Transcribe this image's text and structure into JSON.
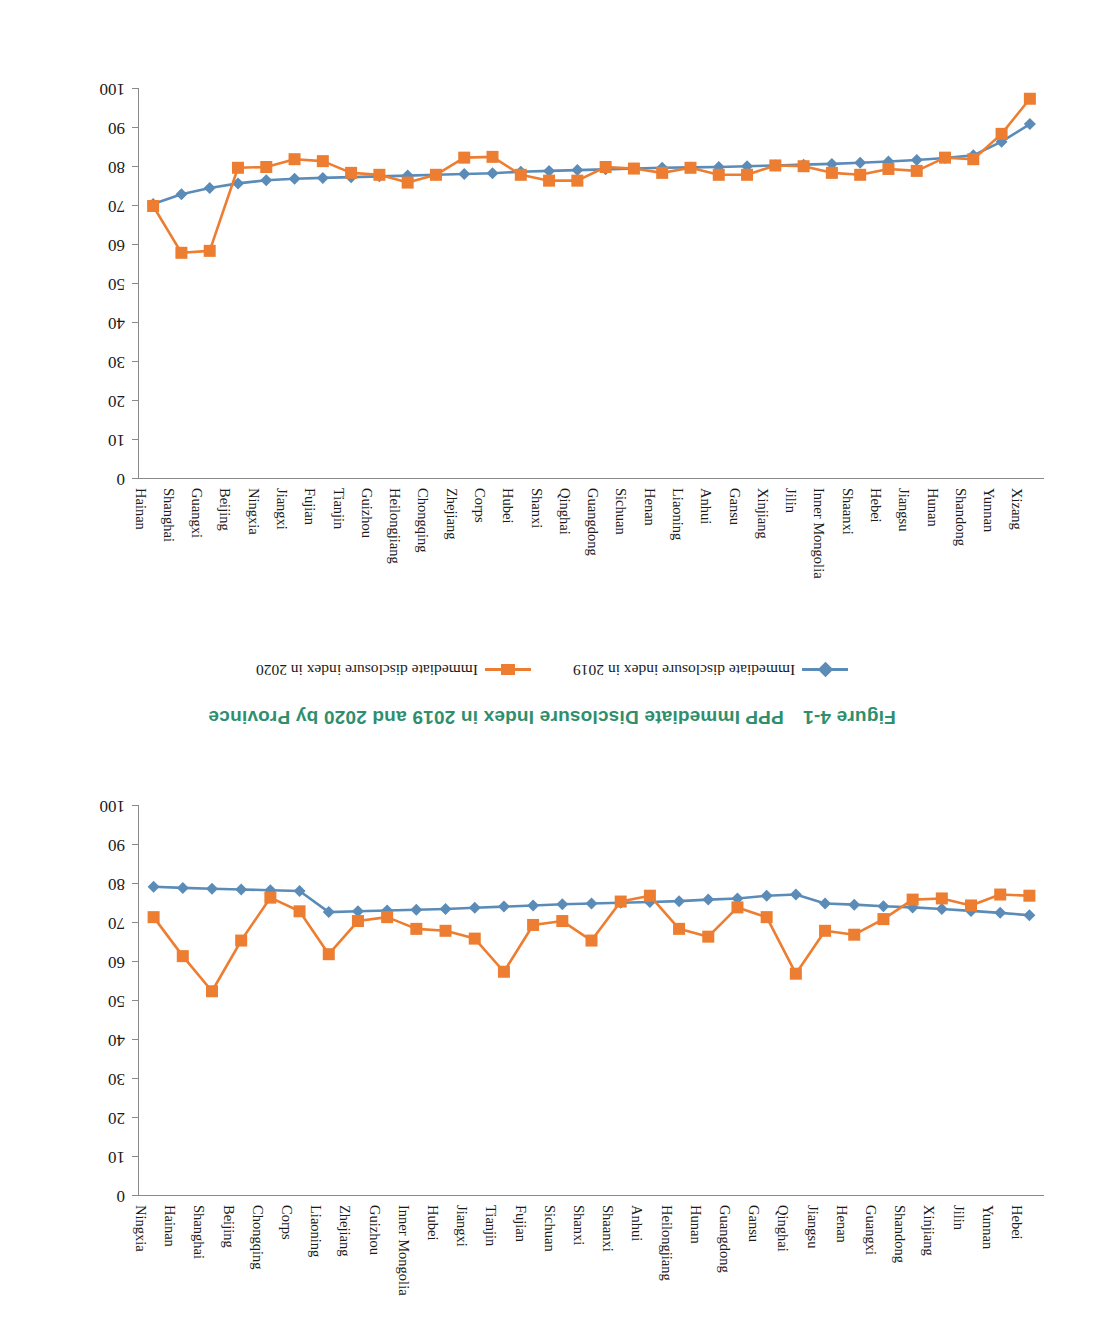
{
  "figure": {
    "title": "Figure 4-1　PPP Immediate Disclosure Index in 2019 and 2020 by Province",
    "title_color": "#2f8f6d"
  },
  "legend": {
    "position": "below-top-chart",
    "items": [
      {
        "label": "Immediate disclosure index in 2019",
        "marker": "diamond",
        "color": "#5b8cb8"
      },
      {
        "label": "Immediate disclosure index in 2020",
        "marker": "square",
        "color": "#ed7d31"
      }
    ]
  },
  "axis": {
    "y_ticks": [
      "0",
      "10",
      "20",
      "30",
      "40",
      "50",
      "60",
      "70",
      "80",
      "90",
      "100"
    ],
    "y_min": 0,
    "y_max": 100
  },
  "chart_data": [
    {
      "type": "line",
      "id": "top-chart",
      "title": "",
      "xlabel": "",
      "ylabel": "",
      "ylim": [
        0,
        100
      ],
      "y_inverted": true,
      "grid": false,
      "legend_position": "below",
      "categories": [
        "Hebei",
        "Yunnan",
        "Jilin",
        "Xinjiang",
        "Shandong",
        "Guangxi",
        "Henan",
        "Jiangsu",
        "Qinghai",
        "Gansu",
        "Guangdong",
        "Hunan",
        "Heilongjiang",
        "Anhui",
        "Shaanxi",
        "Shanxi",
        "Sichuan",
        "Fujian",
        "Tianjin",
        "Jiangxi",
        "Hubei",
        "Inner Mongolia",
        "Guizhou",
        "Zhejiang",
        "Liaoning",
        "Corps",
        "Chongqing",
        "Beijing",
        "Shanghai",
        "Hainan",
        "Ningxia"
      ],
      "series": [
        {
          "name": "Immediate disclosure index in 2019",
          "color": "#5b8cb8",
          "marker": "diamond",
          "values": [
            72.0,
            72.6,
            73.1,
            73.6,
            74.0,
            74.3,
            74.7,
            75.0,
            77.3,
            77.0,
            76.3,
            76.0,
            75.6,
            75.4,
            75.2,
            75.0,
            74.8,
            74.5,
            74.2,
            73.9,
            73.6,
            73.4,
            73.2,
            73.0,
            72.8,
            78.2,
            78.4,
            78.6,
            78.8,
            79.0,
            79.3
          ]
        },
        {
          "name": "Immediate disclosure index in 2020",
          "color": "#ed7d31",
          "marker": "square",
          "values": [
            77.0,
            77.3,
            74.5,
            76.3,
            76.0,
            71.0,
            67.0,
            68.0,
            57.0,
            71.5,
            74.0,
            66.5,
            68.5,
            77.0,
            75.5,
            65.5,
            70.5,
            69.5,
            57.5,
            66.0,
            68.0,
            68.5,
            71.5,
            70.5,
            62.0,
            73.0,
            76.5,
            65.5,
            52.5,
            61.5,
            71.5
          ]
        }
      ]
    },
    {
      "type": "line",
      "id": "bottom-chart",
      "title": "",
      "xlabel": "",
      "ylabel": "",
      "ylim": [
        0,
        100
      ],
      "y_inverted": true,
      "grid": false,
      "legend_position": "above",
      "categories": [
        "Xizang",
        "Yunnan",
        "Shandong",
        "Hunan",
        "Jiangsu",
        "Hebei",
        "Shaanxi",
        "Inner Mongolia",
        "Jilin",
        "Xinjiang",
        "Gansu",
        "Anhui",
        "Liaoning",
        "Henan",
        "Sichuan",
        "Guangdong",
        "Qinghai",
        "Shanxi",
        "Hubei",
        "Corps",
        "Zhejiang",
        "Chongqing",
        "Heilongjiang",
        "Guizhou",
        "Tianjin",
        "Fujian",
        "Jiangxi",
        "Ningxia",
        "Beijing",
        "Guangxi",
        "Shanghai",
        "Hainan"
      ],
      "series": [
        {
          "name": "Immediate disclosure index in 2019",
          "color": "#5b8cb8",
          "marker": "diamond",
          "values": [
            91.0,
            86.5,
            83.0,
            82.3,
            81.8,
            81.4,
            81.1,
            80.8,
            80.6,
            80.4,
            80.2,
            80.0,
            79.9,
            79.8,
            79.6,
            79.4,
            79.2,
            79.0,
            78.8,
            78.4,
            78.2,
            78.0,
            77.8,
            77.6,
            77.4,
            77.2,
            77.0,
            76.6,
            75.8,
            74.6,
            73.0,
            70.5
          ]
        },
        {
          "name": "Immediate disclosure index in 2020",
          "color": "#ed7d31",
          "marker": "square",
          "values": [
            97.5,
            88.5,
            82.0,
            82.4,
            79.0,
            79.5,
            78.0,
            78.5,
            80.2,
            80.4,
            78.0,
            78.0,
            79.8,
            78.5,
            79.6,
            80.0,
            76.5,
            76.5,
            78.0,
            82.6,
            82.4,
            78.0,
            76.0,
            78.0,
            78.5,
            81.5,
            82.0,
            80.0,
            79.8,
            58.5,
            58.0,
            70.0
          ]
        }
      ]
    }
  ]
}
